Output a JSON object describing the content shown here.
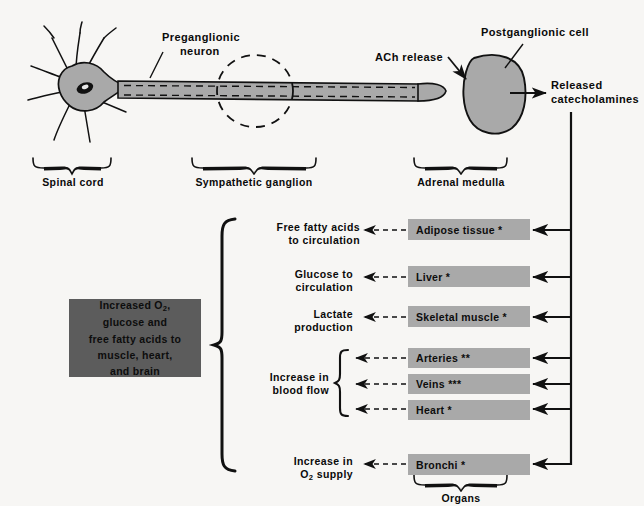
{
  "figure": {
    "type": "diagram"
  },
  "top_diagram": {
    "labels": {
      "preganglionic_neuron": "Preganglionic\nneuron",
      "preganglionic_neuron_line1": "Preganglionic",
      "preganglionic_neuron_line2": "neuron",
      "ach_release": "ACh release",
      "postganglionic_cell": "Postganglionic cell",
      "released_catecholamines_line1": "Released",
      "released_catecholamines_line2": "catecholamines"
    },
    "regions": [
      {
        "name": "spinal-cord",
        "label": "Spinal cord"
      },
      {
        "name": "sympathetic-ganglion",
        "label": "Sympathetic ganglion"
      },
      {
        "name": "adrenal-medulla",
        "label": "Adrenal medulla"
      }
    ]
  },
  "effects_box": {
    "lines": [
      "Increased O2,",
      "glucose and",
      "free fatty acids to",
      "muscle, heart,",
      "and brain"
    ],
    "line1_pre": "Increased O",
    "line1_sub": "2",
    "line1_post": ",",
    "line2": "glucose and",
    "line3": "free fatty acids to",
    "line4": "muscle, heart,",
    "line5": "and brain"
  },
  "effects": [
    {
      "name": "free-fatty-acids",
      "line1": "Free fatty acids",
      "line2": "to circulation"
    },
    {
      "name": "glucose",
      "line1": "Glucose to",
      "line2": "circulation"
    },
    {
      "name": "lactate",
      "line1": "Lactate",
      "line2": "production"
    },
    {
      "name": "blood-flow",
      "line1": "Increase in",
      "line2": "blood flow"
    },
    {
      "name": "o2-supply",
      "line1": "Increase in",
      "line2_pre": "O",
      "line2_sub": "2",
      "line2_post": " supply"
    }
  ],
  "organs": {
    "group_label": "Organs",
    "items": [
      {
        "name": "adipose-tissue",
        "label": "Adipose tissue *"
      },
      {
        "name": "liver",
        "label": "Liver *"
      },
      {
        "name": "skeletal-muscle",
        "label": "Skeletal muscle *"
      },
      {
        "name": "arteries",
        "label": "Arteries **"
      },
      {
        "name": "veins",
        "label": "Veins ***"
      },
      {
        "name": "heart",
        "label": "Heart *"
      },
      {
        "name": "bronchi",
        "label": "Bronchi *"
      }
    ]
  },
  "colors": {
    "organ_box": "#a9a9a9",
    "effects_box": "#5c5c5c",
    "cell_fill": "#a9a9a9",
    "stroke": "#111111",
    "page_bg": "#f7f6f4"
  }
}
